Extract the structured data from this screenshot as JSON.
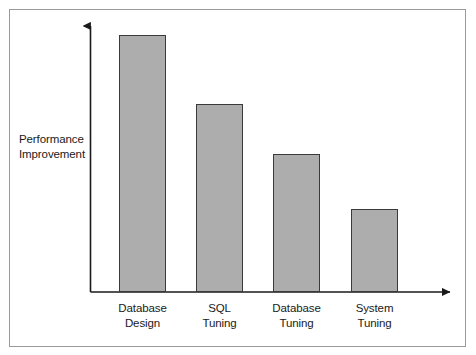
{
  "figure": {
    "background_color": "#ffffff",
    "frame_color": "#9a9a9a"
  },
  "chart_data": {
    "type": "bar",
    "title": "",
    "subtitle": "",
    "xlabel": "",
    "ylabel": "Performance Improvement",
    "ylabel_lines": [
      "Performance",
      "Improvement"
    ],
    "categories": [
      "Database Design",
      "SQL Tuning",
      "Database Tuning",
      "System Tuning"
    ],
    "category_lines": [
      [
        "Database",
        "Design"
      ],
      [
        "SQL",
        "Tuning"
      ],
      [
        "Database",
        "Tuning"
      ],
      [
        "System",
        "Tuning"
      ]
    ],
    "values": [
      100,
      73,
      54,
      32
    ],
    "ylim": [
      0,
      105
    ],
    "xlim": [
      0,
      4
    ],
    "grid": false,
    "legend": null,
    "tick_labels_y": [],
    "annotations": [],
    "bar_fill_color": "#adadad",
    "bar_edge_color": "#3a3a3a",
    "axis_color": "#1a1a1a",
    "axis_arrows": true,
    "series": [
      {
        "name": "Performance Improvement",
        "values": [
          100,
          73,
          54,
          32
        ]
      }
    ]
  },
  "geometry": {
    "baseline_y": 292,
    "axis_x": 90.5,
    "axis_top_y": 21,
    "axis_right_x": 456,
    "bar_width": 47,
    "bars": [
      {
        "left": 119,
        "top": 35,
        "height": 257
      },
      {
        "left": 196,
        "top": 104,
        "height": 188
      },
      {
        "left": 273,
        "top": 154,
        "height": 138
      },
      {
        "left": 351,
        "top": 209,
        "height": 83
      }
    ],
    "label_centers": [
      142.5,
      219.5,
      296.5,
      374.5
    ]
  }
}
